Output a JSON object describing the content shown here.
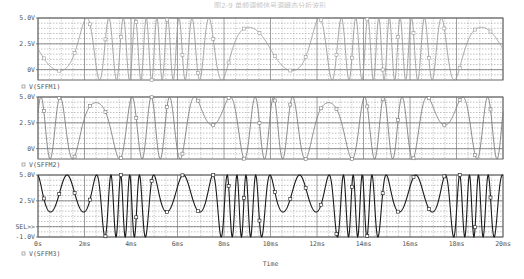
{
  "title": "图2-9 单频调频信号源瞬态分析波形",
  "chart_data": [
    {
      "type": "line",
      "panel": "top",
      "legend": "V(SFFM1)",
      "ytick_labels": [
        "5.0V",
        "2.5V",
        "0V"
      ],
      "ytick_values": [
        5.0,
        2.5,
        0
      ],
      "ylim": [
        -1.0,
        5.0
      ],
      "xlim_ms": [
        0,
        20
      ],
      "grid": true,
      "trace_color": "#9a9a9a",
      "sffm": {
        "offset": 2.0,
        "amplitude": 3.0,
        "carrier_khz": 1.0,
        "mod_index": 12,
        "signal_khz": 0.1,
        "phase_deg": 180
      }
    },
    {
      "type": "line",
      "panel": "middle",
      "legend": "V(SFFM2)",
      "ytick_labels": [
        "5.0V",
        "2.5V",
        "0V"
      ],
      "ytick_values": [
        5.0,
        2.5,
        0
      ],
      "ylim": [
        -1.0,
        5.0
      ],
      "xlim_ms": [
        0,
        20
      ],
      "grid": true,
      "trace_color": "#7a7a7a",
      "sffm": {
        "offset": 2.0,
        "amplitude": 3.0,
        "carrier_khz": 0.0,
        "mod_index": 13,
        "signal_khz": 0.1,
        "phase_deg": 0
      }
    },
    {
      "type": "line",
      "panel": "bottom",
      "legend": "V(SFFM3)",
      "ytick_labels": [
        "5.0V",
        "2.5V",
        "SEL>>",
        "-1.0V"
      ],
      "ytick_values": [
        5.0,
        2.5,
        0,
        -1.0
      ],
      "ylim": [
        -1.0,
        5.0
      ],
      "xlim_ms": [
        0,
        20
      ],
      "grid": true,
      "trace_color": "#1a1a1a",
      "sffm": {
        "offset": 2.0,
        "amplitude": 3.0,
        "carrier_khz": 1.0,
        "mod_index": 8,
        "signal_khz": 0.2,
        "phase_deg": 90
      }
    }
  ],
  "xaxis": {
    "label": "Time",
    "tick_labels": [
      "0s",
      "2ms",
      "4ms",
      "6ms",
      "8ms",
      "10ms",
      "12ms",
      "14ms",
      "16ms",
      "18ms",
      "20ms"
    ],
    "tick_values_ms": [
      0,
      2,
      4,
      6,
      8,
      10,
      12,
      14,
      16,
      18,
      20
    ]
  }
}
